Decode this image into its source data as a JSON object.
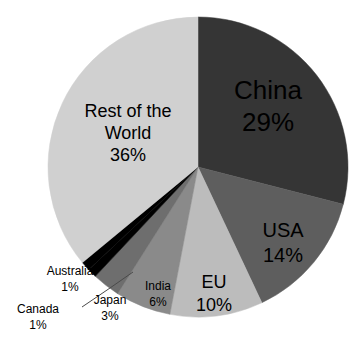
{
  "chart_data": {
    "type": "pie",
    "title": "",
    "subtitle": "",
    "xlabel": "",
    "ylabel": "",
    "legend_position": "none",
    "grid": false,
    "units": "percent",
    "start_angle_deg": 0,
    "direction": "clockwise",
    "categories": [
      "China",
      "USA",
      "EU",
      "India",
      "Japan",
      "Canada",
      "Australia",
      "Rest of the World"
    ],
    "values": [
      29,
      14,
      10,
      6,
      3,
      1,
      1,
      36
    ],
    "slices": [
      {
        "name": "China",
        "label": "China",
        "value": 29,
        "value_label": "29%",
        "color": "#353535",
        "text_color": "#000000",
        "label_placement": "inside",
        "font_size": 26,
        "label_x": 268,
        "label_y": 92,
        "value_x": 268,
        "value_y": 124
      },
      {
        "name": "USA",
        "label": "USA",
        "value": 14,
        "value_label": "14%",
        "color": "#5e5e5e",
        "text_color": "#000000",
        "label_placement": "inside",
        "font_size": 20,
        "label_x": 283,
        "label_y": 232,
        "value_x": 283,
        "value_y": 257
      },
      {
        "name": "EU",
        "label": "EU",
        "value": 10,
        "value_label": "10%",
        "color": "#bcbcbc",
        "text_color": "#000000",
        "label_placement": "inside",
        "font_size": 18,
        "label_x": 214,
        "label_y": 283,
        "value_x": 214,
        "value_y": 306
      },
      {
        "name": "India",
        "label": "India",
        "value": 6,
        "value_label": "6%",
        "color": "#8a8a8a",
        "text_color": "#000000",
        "label_placement": "inside",
        "font_size": 12,
        "label_x": 158,
        "label_y": 287,
        "value_x": 158,
        "value_y": 303
      },
      {
        "name": "Japan",
        "label": "Japan",
        "value": 3,
        "value_label": "3%",
        "color": "#6e6e6e",
        "text_color": "#000000",
        "label_placement": "outside",
        "font_size": 12,
        "label_x": 110,
        "label_y": 301,
        "value_x": 110,
        "value_y": 317
      },
      {
        "name": "Canada",
        "label": "Canada",
        "value": 1,
        "value_label": "1%",
        "color": "#000000",
        "text_color": "#000000",
        "label_placement": "outside",
        "font_size": 12,
        "label_x": 38,
        "label_y": 310,
        "value_x": 38,
        "value_y": 326
      },
      {
        "name": "Australia",
        "label": "Australia",
        "value": 1,
        "value_label": "1%",
        "color": "#000000",
        "text_color": "#000000",
        "label_placement": "outside",
        "font_size": 12,
        "label_x": 70,
        "label_y": 272,
        "value_x": 70,
        "value_y": 288
      },
      {
        "name": "Rest of the World",
        "label_line_1": "Rest of the",
        "label_line_2": "World",
        "value": 36,
        "value_label": "36%",
        "color": "#d0d0d0",
        "text_color": "#000000",
        "label_placement": "inside",
        "font_size": 18,
        "label_x": 128,
        "label_y": 112,
        "label2_x": 128,
        "label2_y": 134,
        "value_x": 128,
        "value_y": 156
      }
    ],
    "geometry": {
      "center_x": 198,
      "center_y": 167,
      "radius": 150
    },
    "background_color": "#ffffff",
    "leader_line_color": "#4a4a4a"
  }
}
